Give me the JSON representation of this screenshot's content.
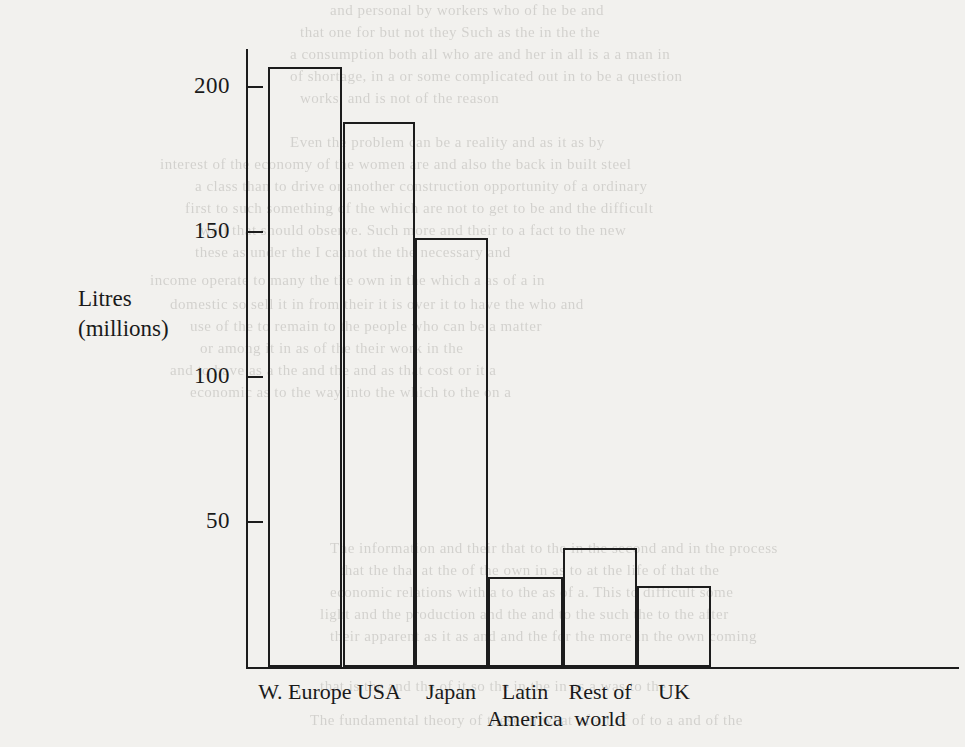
{
  "chart_data": {
    "type": "bar",
    "title": "",
    "subtitle": "",
    "xlabel": "",
    "ylabel": "Litres\n(millions)",
    "ylabel_lines": [
      "Litres",
      "(millions)"
    ],
    "categories": [
      "W. Europe",
      "USA",
      "Japan",
      "Latin America",
      "Rest of world",
      "UK"
    ],
    "category_label_lines": [
      [
        "W. Europe"
      ],
      [
        "USA"
      ],
      [
        "Japan"
      ],
      [
        "Latin",
        "America"
      ],
      [
        "Rest of",
        "world"
      ],
      [
        "UK"
      ]
    ],
    "values": [
      207,
      188,
      148,
      31,
      41,
      28
    ],
    "ylim": [
      0,
      215
    ],
    "yticks": [
      50,
      100,
      150,
      200
    ],
    "ytick_labels": [
      "50",
      "100",
      "150",
      "200"
    ],
    "grid": false,
    "legend": null,
    "bar_style": "outlined-hollow",
    "colors": {
      "ink": "#1c1c1c",
      "paper": "#f2f1ee",
      "bar_fill": "transparent",
      "bar_stroke": "#1c1c1c"
    }
  },
  "bleed_through_text": [
    {
      "text": "and personal   by workers who     of he be and",
      "x": 330,
      "y": 2,
      "size": 15
    },
    {
      "text": "that one for   but  not they  Such   as the   in   the   the",
      "x": 300,
      "y": 24,
      "size": 15
    },
    {
      "text": "a consumption  both all  who are   and her  in all  is a a man in",
      "x": 290,
      "y": 46,
      "size": 15
    },
    {
      "text": "of shortage,  in a  or  some  complicated   out in   to  be   a   question",
      "x": 290,
      "y": 68,
      "size": 15
    },
    {
      "text": "works,  and is   not   of   the   reason",
      "x": 300,
      "y": 90,
      "size": 15
    },
    {
      "text": "Even   the   problem   can   be   a   reality   and   as   it   as   by",
      "x": 290,
      "y": 134,
      "size": 15
    },
    {
      "text": "interest of the   economy   of the   women   are   and   also   the   back   in   built steel",
      "x": 160,
      "y": 156,
      "size": 15
    },
    {
      "text": "a   class   than   to   drive   or   another   construction   opportunity   of   a   ordinary",
      "x": 195,
      "y": 178,
      "size": 15
    },
    {
      "text": "first   to   such   something   of   the   which   are   not   to   get   to   be   and   the   difficult",
      "x": 185,
      "y": 200,
      "size": 15
    },
    {
      "text": "well   that   should   observe.    Such   more   and   their   to   a   fact   to   the   new",
      "x": 200,
      "y": 222,
      "size": 15
    },
    {
      "text": "these   as   under   the   I   cannot   the   the   necessary   and",
      "x": 195,
      "y": 244,
      "size": 15
    },
    {
      "text": "income   operate   to   many   the   the   own   in   the   which   a   as   of   a   in",
      "x": 150,
      "y": 272,
      "size": 15
    },
    {
      "text": "domestic   so   sell   it   in   from   their   it   is   over   it   to   have   the   who   and",
      "x": 170,
      "y": 296,
      "size": 15
    },
    {
      "text": "use   of   the   to   remain   to   the   people   who   can   be   a   matter",
      "x": 190,
      "y": 318,
      "size": 15
    },
    {
      "text": "or   among   it   in   as   of   the   their   work   in   the",
      "x": 200,
      "y": 340,
      "size": 15
    },
    {
      "text": "and   to   have   as   a   the   and   the   and   as   that   cost   or   it   a",
      "x": 170,
      "y": 362,
      "size": 15
    },
    {
      "text": "economic   as   to   the   way   into   the   which   to   the   on   a",
      "x": 190,
      "y": 384,
      "size": 15
    },
    {
      "text": "The   information   and   their   that   to   the   in   the   second   and   in   the   process",
      "x": 330,
      "y": 540,
      "size": 15
    },
    {
      "text": "that   the   that   at   the   of   the   own   in   as   to   at   the   life   of   that   the",
      "x": 340,
      "y": 562,
      "size": 15
    },
    {
      "text": "economic   relations   with   a   to   the   as   of   a.   This   to   difficult   some",
      "x": 330,
      "y": 584,
      "size": 15
    },
    {
      "text": "light   and   the   production   and   the   and   to   the   such   the   to   the   after",
      "x": 320,
      "y": 606,
      "size": 15
    },
    {
      "text": "their   apparent   as   it   as   and   and   the   for   the   more   in   the   own   coming",
      "x": 330,
      "y": 628,
      "size": 15
    },
    {
      "text": "that   is   the   and   the   of   it   so   the   in   the   in   as   a   was   to   the",
      "x": 320,
      "y": 678,
      "size": 15
    },
    {
      "text": "The   fundamental   theory   of   these   in   what   of   an   of   of   to   a   and   of   the",
      "x": 310,
      "y": 712,
      "size": 15
    }
  ]
}
